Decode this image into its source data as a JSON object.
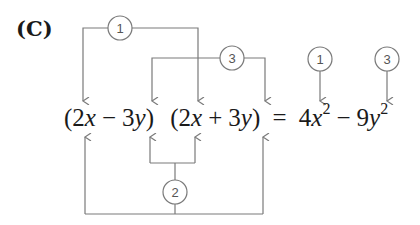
{
  "label": "(C)",
  "equation": {
    "factor1": {
      "open": "(2",
      "var1": "x",
      "op": "−",
      "coef": "3",
      "var2": "y",
      "close": ")"
    },
    "factor2": {
      "open": "(2",
      "var1": "x",
      "op": "+",
      "coef": "3",
      "var2": "y",
      "close": ")"
    },
    "equals": "=",
    "result": {
      "term1_coef": "4",
      "term1_var": "x",
      "term1_exp": "2",
      "op": "−",
      "term2_coef": "9",
      "term2_var": "y",
      "term2_exp": "2"
    }
  },
  "markers": {
    "step1_top": "1",
    "step3_top": "3",
    "step1_result": "1",
    "step3_result": "3",
    "step2_bottom": "2"
  },
  "colors": {
    "line": "#7a7a7a",
    "text": "#1a1a1a",
    "circle": "#555555"
  }
}
